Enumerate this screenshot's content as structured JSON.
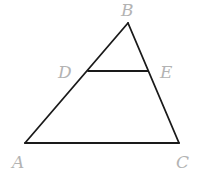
{
  "diagram": {
    "type": "geometry-triangle",
    "points": {
      "A": {
        "label": "A",
        "x": 25,
        "y": 143,
        "lx": 12,
        "ly": 168
      },
      "B": {
        "label": "B",
        "x": 128,
        "y": 23,
        "lx": 121,
        "ly": 16
      },
      "C": {
        "label": "C",
        "x": 179,
        "y": 143,
        "lx": 176,
        "ly": 168
      },
      "D": {
        "label": "D",
        "x": 88,
        "y": 71,
        "lx": 58,
        "ly": 78
      },
      "E": {
        "label": "E",
        "x": 148,
        "y": 71,
        "lx": 160,
        "ly": 78
      }
    },
    "segments": [
      {
        "from": "A",
        "to": "B"
      },
      {
        "from": "B",
        "to": "C"
      },
      {
        "from": "A",
        "to": "C"
      },
      {
        "from": "D",
        "to": "E"
      }
    ],
    "colors": {
      "line": "#1a1a1a",
      "label": "#b3b3b3"
    }
  }
}
